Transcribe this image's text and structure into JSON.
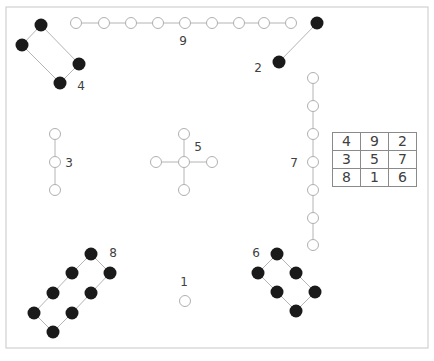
{
  "figure": {
    "colors": {
      "frame": "#c8c8c8",
      "line": "#b4b4b4",
      "open_dot_stroke": "#b0b0b0",
      "filled_dot": "#1a1a1a",
      "label_text": "#404040"
    },
    "groups": [
      {
        "label": "1",
        "label_pos": [
          184,
          286
        ],
        "dot_type": "open",
        "dots": [
          [
            185,
            301
          ]
        ],
        "edges": []
      },
      {
        "label": "2",
        "label_pos": [
          258,
          72
        ],
        "dot_type": "filled",
        "dots": [
          [
            317,
            23
          ],
          [
            279,
            62
          ]
        ],
        "edges": [
          [
            0,
            1
          ]
        ]
      },
      {
        "label": "3",
        "label_pos": [
          69,
          167
        ],
        "dot_type": "open",
        "dots": [
          [
            55,
            134
          ],
          [
            55,
            162
          ],
          [
            55,
            190
          ]
        ],
        "edges": [
          [
            0,
            1
          ],
          [
            1,
            2
          ]
        ]
      },
      {
        "label": "4",
        "label_pos": [
          81,
          90
        ],
        "dot_type": "filled",
        "dots": [
          [
            41,
            25
          ],
          [
            22,
            45
          ],
          [
            79,
            64
          ],
          [
            60,
            83
          ]
        ],
        "edges": [
          [
            0,
            1
          ],
          [
            0,
            2
          ],
          [
            1,
            3
          ],
          [
            2,
            3
          ]
        ]
      },
      {
        "label": "5",
        "label_pos": [
          198,
          151
        ],
        "dot_type": "open",
        "dots": [
          [
            184,
            134
          ],
          [
            156,
            162
          ],
          [
            184,
            162
          ],
          [
            212,
            162
          ],
          [
            184,
            190
          ]
        ],
        "edges": [
          [
            0,
            2
          ],
          [
            1,
            2
          ],
          [
            2,
            3
          ],
          [
            2,
            4
          ]
        ]
      },
      {
        "label": "6",
        "label_pos": [
          256,
          257
        ],
        "dot_type": "filled",
        "dots": [
          [
            277,
            254
          ],
          [
            258,
            273
          ],
          [
            296,
            273
          ],
          [
            277,
            292
          ],
          [
            315,
            292
          ],
          [
            296,
            311
          ]
        ],
        "edges": [
          [
            0,
            1
          ],
          [
            0,
            2
          ],
          [
            1,
            3
          ],
          [
            2,
            4
          ],
          [
            3,
            5
          ],
          [
            4,
            5
          ]
        ]
      },
      {
        "label": "7",
        "label_pos": [
          294,
          167
        ],
        "dot_type": "open",
        "dots": [
          [
            313,
            78
          ],
          [
            313,
            106
          ],
          [
            313,
            134
          ],
          [
            313,
            162
          ],
          [
            313,
            190
          ],
          [
            313,
            218
          ],
          [
            313,
            245
          ]
        ],
        "edges": [
          [
            0,
            1
          ],
          [
            1,
            2
          ],
          [
            2,
            3
          ],
          [
            3,
            4
          ],
          [
            4,
            5
          ],
          [
            5,
            6
          ]
        ]
      },
      {
        "label": "8",
        "label_pos": [
          113,
          257
        ],
        "dot_type": "filled",
        "dots": [
          [
            91,
            254
          ],
          [
            72,
            273
          ],
          [
            110,
            273
          ],
          [
            53,
            293
          ],
          [
            91,
            293
          ],
          [
            34,
            313
          ],
          [
            72,
            313
          ],
          [
            53,
            332
          ]
        ],
        "edges": [
          [
            0,
            1
          ],
          [
            0,
            2
          ],
          [
            1,
            3
          ],
          [
            2,
            4
          ],
          [
            3,
            5
          ],
          [
            4,
            6
          ],
          [
            5,
            7
          ],
          [
            6,
            7
          ]
        ]
      },
      {
        "label": "9",
        "label_pos": [
          183,
          45
        ],
        "dot_type": "open",
        "dots": [
          [
            76,
            23
          ],
          [
            104,
            23
          ],
          [
            131,
            23
          ],
          [
            158,
            23
          ],
          [
            185,
            23
          ],
          [
            212,
            23
          ],
          [
            239,
            23
          ],
          [
            264,
            23
          ],
          [
            291,
            23
          ]
        ],
        "edges": [
          [
            0,
            1
          ],
          [
            1,
            2
          ],
          [
            2,
            3
          ],
          [
            3,
            4
          ],
          [
            4,
            5
          ],
          [
            5,
            6
          ],
          [
            6,
            7
          ],
          [
            7,
            8
          ]
        ]
      }
    ],
    "magic_square": {
      "rows": [
        [
          "4",
          "9",
          "2"
        ],
        [
          "3",
          "5",
          "7"
        ],
        [
          "8",
          "1",
          "6"
        ]
      ]
    }
  }
}
